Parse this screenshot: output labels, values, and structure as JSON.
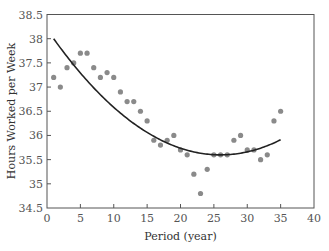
{
  "chart_data": {
    "type": "scatter",
    "title": "",
    "xlabel": "Period (year)",
    "ylabel": "Hours Worked per Week",
    "xlim": [
      0,
      40
    ],
    "ylim": [
      34.5,
      38.5
    ],
    "xticks": [
      0,
      5,
      10,
      15,
      20,
      25,
      30,
      35,
      40
    ],
    "yticks": [
      34.5,
      35,
      35.5,
      36,
      36.5,
      37,
      37.5,
      38,
      38.5
    ],
    "ytick_labels": [
      "34.5",
      "35",
      "35.5",
      "36",
      "36.5",
      "37",
      "37.5",
      "38",
      "38.5"
    ],
    "grid": false,
    "legend": null,
    "series": [
      {
        "name": "Observed hours",
        "kind": "scatter",
        "color": "#8a8a8a",
        "x": [
          1,
          2,
          3,
          4,
          5,
          6,
          7,
          8,
          9,
          10,
          11,
          12,
          13,
          14,
          15,
          16,
          17,
          18,
          19,
          20,
          21,
          22,
          23,
          24,
          25,
          26,
          27,
          28,
          29,
          30,
          31,
          32,
          33,
          34,
          35
        ],
        "y": [
          37.2,
          37.0,
          37.4,
          37.5,
          37.7,
          37.7,
          37.4,
          37.2,
          37.3,
          37.2,
          36.9,
          36.7,
          36.7,
          36.5,
          36.3,
          35.9,
          35.8,
          35.9,
          36.0,
          35.7,
          35.6,
          35.2,
          34.8,
          35.3,
          35.6,
          35.6,
          35.6,
          35.9,
          36.0,
          35.7,
          35.7,
          35.5,
          35.6,
          36.3,
          36.5
        ]
      },
      {
        "name": "Quadratic trend",
        "kind": "line",
        "color": "#222222",
        "x": [
          1,
          5,
          10,
          15,
          20,
          25,
          26,
          30,
          35
        ],
        "y": [
          38.0,
          37.29,
          36.58,
          36.06,
          35.74,
          35.6,
          35.6,
          35.66,
          35.91
        ]
      }
    ]
  },
  "labels": {
    "xlabel": "Period (year)",
    "ylabel": "Hours Worked per Week"
  }
}
